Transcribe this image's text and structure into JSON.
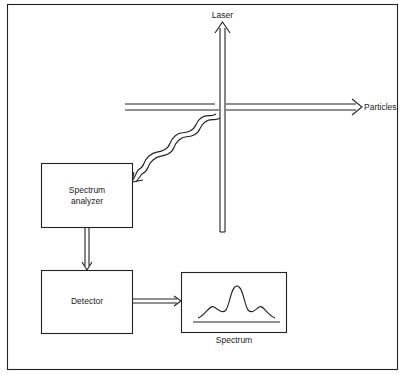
{
  "diagram": {
    "type": "flow/schematic",
    "labels": {
      "laser": "Laser",
      "particles": "Particles",
      "analyzer_line1": "Spectrum",
      "analyzer_line2": "analyzer",
      "detector": "Detector",
      "spectrum": "Spectrum"
    },
    "nodes": [
      {
        "id": "laser-beam",
        "label": "Laser",
        "kind": "double-arrow-vertical"
      },
      {
        "id": "particle-beam",
        "label": "Particles",
        "kind": "double-arrow-horizontal"
      },
      {
        "id": "spectrum-analyzer",
        "label": "Spectrum analyzer",
        "kind": "box"
      },
      {
        "id": "detector",
        "label": "Detector",
        "kind": "box"
      },
      {
        "id": "spectrum-display",
        "label": "Spectrum",
        "kind": "box-with-curve"
      }
    ],
    "edges": [
      {
        "from": "beam-intersection",
        "to": "spectrum-analyzer",
        "style": "wavy-double-arrow"
      },
      {
        "from": "spectrum-analyzer",
        "to": "detector",
        "style": "double-arrow"
      },
      {
        "from": "detector",
        "to": "spectrum-display",
        "style": "double-arrow"
      }
    ],
    "colors": {
      "line": "#222222",
      "background": "#ffffff"
    }
  }
}
